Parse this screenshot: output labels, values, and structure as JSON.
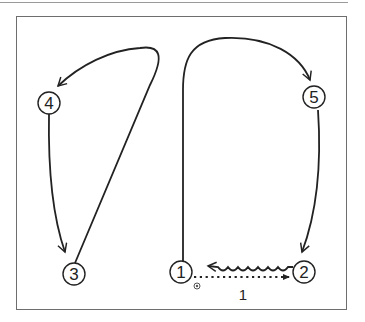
{
  "diagram": {
    "type": "soccer-drill-movement-pattern",
    "stroke_color": "#222222",
    "nodes": [
      {
        "id": "1",
        "label": "1",
        "cx": 181,
        "cy": 272
      },
      {
        "id": "2",
        "label": "2",
        "cx": 304,
        "cy": 272
      },
      {
        "id": "3",
        "label": "3",
        "cx": 74,
        "cy": 274
      },
      {
        "id": "4",
        "label": "4",
        "cx": 49,
        "cy": 103
      },
      {
        "id": "5",
        "label": "5",
        "cx": 314,
        "cy": 97
      }
    ],
    "edges": [
      {
        "from": "1",
        "to": "5",
        "style": "solid-run",
        "label": ""
      },
      {
        "from": "5",
        "to": "2",
        "style": "solid-run",
        "label": ""
      },
      {
        "from": "1",
        "to": "2",
        "style": "dotted-pass",
        "label": "1"
      },
      {
        "from": "2",
        "to": "1",
        "style": "wavy-dribble",
        "label": ""
      },
      {
        "from": "3",
        "to": "4",
        "style": "solid-run",
        "label": ""
      },
      {
        "from": "4",
        "to": "3",
        "style": "solid-run",
        "label": ""
      }
    ],
    "pass_label": "1",
    "ball_icon": "soccer-ball-icon"
  }
}
